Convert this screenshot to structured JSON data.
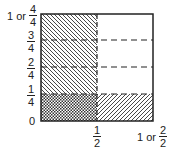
{
  "diagram": {
    "title": "",
    "y_labels": [
      {
        "prefix": "1 or",
        "num": "4",
        "den": "4"
      },
      {
        "num": "3",
        "den": "4"
      },
      {
        "num": "2",
        "den": "4"
      },
      {
        "num": "1",
        "den": "4"
      },
      {
        "text": "0"
      }
    ],
    "x_labels": [
      {
        "num": "1",
        "den": "2"
      },
      {
        "prefix": "1 or",
        "num": "2",
        "den": "2"
      }
    ],
    "regions": [
      {
        "name": "left-half",
        "fill": "diagonal-hatch-backslash",
        "span": "x 0-1/2, y 0-1"
      },
      {
        "name": "bottom-quarter",
        "fill": "diagonal-hatch-slash",
        "span": "x 0-1, y 0-1/4"
      },
      {
        "name": "overlap",
        "fill": "cross-hatch",
        "span": "x 0-1/2, y 0-1/4"
      }
    ],
    "colors": {
      "line": "#222222",
      "background": "#ffffff"
    }
  }
}
